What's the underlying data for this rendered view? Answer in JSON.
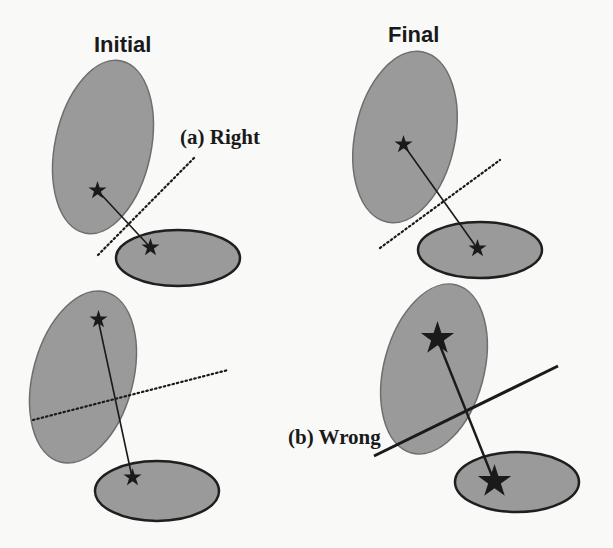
{
  "headings": {
    "initial": "Initial",
    "final": "Final"
  },
  "labels": {
    "right": "(a) Right",
    "wrong": "(b) Wrong"
  },
  "colors": {
    "background": "#f9f9f8",
    "ellipse_fill": "#9a9a9a",
    "ellipse_stroke_light": "#6e6e6e",
    "ellipse_stroke_dark": "#1f1f1f",
    "star": "#1a1a1a",
    "line": "#1a1a1a"
  },
  "panels": [
    {
      "id": "initial-right",
      "big_ellipse": {
        "cx": 103,
        "cy": 147,
        "rx": 48,
        "ry": 88,
        "rotate": 12
      },
      "small_ellipse": {
        "cx": 178,
        "cy": 258,
        "rx": 62,
        "ry": 28
      },
      "star_a": {
        "x": 97,
        "y": 190,
        "size": "small"
      },
      "star_b": {
        "x": 150,
        "y": 247,
        "size": "small"
      },
      "boundary": {
        "x1": 98,
        "y1": 255,
        "x2": 195,
        "y2": 157,
        "style": "dotted"
      }
    },
    {
      "id": "final-right",
      "big_ellipse": {
        "cx": 405,
        "cy": 137,
        "rx": 50,
        "ry": 87,
        "rotate": 12
      },
      "small_ellipse": {
        "cx": 480,
        "cy": 250,
        "rx": 62,
        "ry": 28
      },
      "star_a": {
        "x": 403,
        "y": 144,
        "size": "small"
      },
      "star_b": {
        "x": 477,
        "y": 248,
        "size": "small"
      },
      "boundary": {
        "x1": 380,
        "y1": 248,
        "x2": 500,
        "y2": 160,
        "style": "dotted"
      }
    },
    {
      "id": "initial-wrong",
      "big_ellipse": {
        "cx": 83,
        "cy": 377,
        "rx": 50,
        "ry": 88,
        "rotate": 15
      },
      "small_ellipse": {
        "cx": 157,
        "cy": 491,
        "rx": 62,
        "ry": 30
      },
      "star_a": {
        "x": 98,
        "y": 319,
        "size": "small"
      },
      "star_b": {
        "x": 132,
        "y": 477,
        "size": "small"
      },
      "boundary": {
        "x1": 33,
        "y1": 420,
        "x2": 228,
        "y2": 370,
        "style": "dotted"
      }
    },
    {
      "id": "final-wrong",
      "big_ellipse": {
        "cx": 434,
        "cy": 369,
        "rx": 50,
        "ry": 87,
        "rotate": 15
      },
      "small_ellipse": {
        "cx": 517,
        "cy": 482,
        "rx": 62,
        "ry": 30
      },
      "star_a": {
        "x": 437,
        "y": 338,
        "size": "large"
      },
      "star_b": {
        "x": 494,
        "y": 481,
        "size": "large"
      },
      "boundary": {
        "x1": 374,
        "y1": 456,
        "x2": 558,
        "y2": 366,
        "style": "solid"
      }
    }
  ]
}
